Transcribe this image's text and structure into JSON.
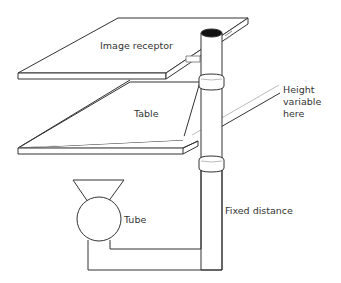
{
  "diagram": {
    "labels": {
      "image_receptor": "Image receptor",
      "table": "Table",
      "height_line1": "Height",
      "height_line2": "variable",
      "height_line3": "here",
      "tube": "Tube",
      "fixed_distance": "Fixed distance"
    },
    "colors": {
      "stroke": "#333333",
      "fill": "#ffffff",
      "aperture": "#111111",
      "shade": "#bbbbbb"
    }
  }
}
